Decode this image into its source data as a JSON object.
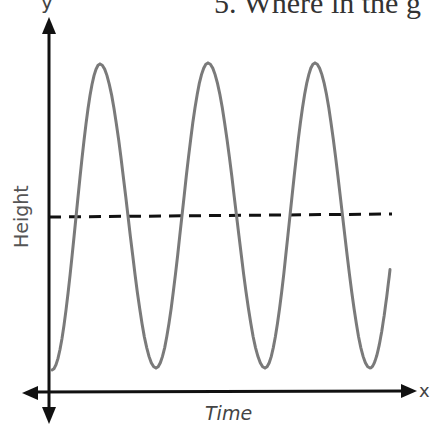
{
  "question": {
    "text": "5. Where in the g"
  },
  "chart_data": {
    "type": "line",
    "title": "",
    "xlabel": "Time",
    "ylabel": "Height",
    "axis_letters": {
      "x": "x",
      "y": "y"
    },
    "grid": false,
    "legend": null,
    "series": [
      {
        "name": "wave",
        "color": "#7a7a7a",
        "style": "solid",
        "points_px": [
          [
            52,
            370
          ],
          [
            100,
            64
          ],
          [
            156,
            368
          ],
          [
            208,
            63
          ],
          [
            265,
            368
          ],
          [
            315,
            63
          ],
          [
            370,
            368
          ],
          [
            390,
            280
          ]
        ],
        "peaks_x_px": [
          100,
          208,
          315
        ],
        "troughs_x_px": [
          52,
          156,
          265,
          370
        ]
      },
      {
        "name": "equilibrium",
        "color": "#111111",
        "style": "dashed",
        "y_px": 216,
        "x_range_px": [
          49,
          392
        ]
      }
    ]
  }
}
